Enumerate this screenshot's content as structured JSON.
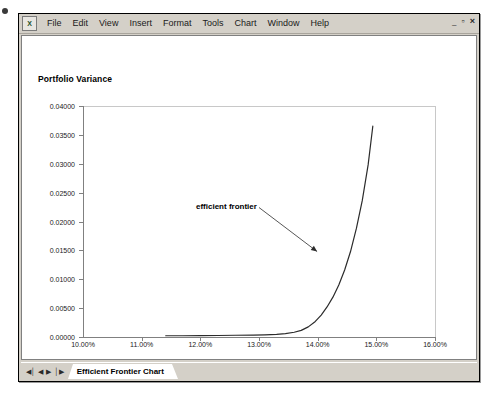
{
  "window": {
    "app_icon_glyph": "X",
    "controls": {
      "minimize": "–",
      "restore": "▫",
      "close": "×"
    }
  },
  "menu": {
    "items": [
      {
        "label": "File",
        "accel": "F"
      },
      {
        "label": "Edit",
        "accel": "E"
      },
      {
        "label": "View",
        "accel": "V"
      },
      {
        "label": "Insert",
        "accel": "I"
      },
      {
        "label": "Format",
        "accel": "o"
      },
      {
        "label": "Tools",
        "accel": "T"
      },
      {
        "label": "Chart",
        "accel": "C"
      },
      {
        "label": "Window",
        "accel": "W"
      },
      {
        "label": "Help",
        "accel": "H"
      }
    ]
  },
  "tab_bar": {
    "nav": {
      "first": "◀│",
      "prev": "◀",
      "next": "▶",
      "last": "│▶"
    },
    "active_sheet": "Efficient Frontier Chart"
  },
  "chart_data": {
    "type": "line",
    "title": "",
    "xlabel": "Portfolio Return",
    "ylabel": "Portfolio Variance",
    "xlim": [
      0.1,
      0.16
    ],
    "ylim": [
      0.0,
      0.04
    ],
    "grid": false,
    "legend": false,
    "xtick_labels": [
      "10.00%",
      "11.00%",
      "12.00%",
      "13.00%",
      "14.00%",
      "15.00%",
      "16.00%"
    ],
    "xtick_values": [
      0.1,
      0.11,
      0.12,
      0.13,
      0.14,
      0.15,
      0.16
    ],
    "ytick_labels": [
      "0.04000",
      "0.03500",
      "0.03000",
      "0.02500",
      "0.02000",
      "0.01500",
      "0.01000",
      "0.00500",
      "0.00000"
    ],
    "ytick_values": [
      0.04,
      0.035,
      0.03,
      0.025,
      0.02,
      0.015,
      0.01,
      0.005,
      0.0
    ],
    "series": [
      {
        "name": "efficient frontier",
        "x": [
          0.1141,
          0.117,
          0.12,
          0.123,
          0.126,
          0.129,
          0.131,
          0.133,
          0.1345,
          0.136,
          0.1372,
          0.1384,
          0.1396,
          0.1406,
          0.1416,
          0.1426,
          0.1436,
          0.1446,
          0.1456,
          0.1466,
          0.1476,
          0.1486,
          0.1494
        ],
        "y": [
          0.00022,
          0.00022,
          0.00024,
          0.00026,
          0.0003,
          0.00034,
          0.00038,
          0.00046,
          0.00058,
          0.00082,
          0.00115,
          0.00175,
          0.0027,
          0.0038,
          0.0052,
          0.0069,
          0.009,
          0.0116,
          0.0148,
          0.0188,
          0.0236,
          0.0298,
          0.0365
        ]
      }
    ],
    "annotations": [
      {
        "text": "efficient frontier",
        "label_x": 0.1225,
        "label_y": 0.021,
        "arrow_to_x": 0.1399,
        "arrow_to_y": 0.0148
      }
    ]
  }
}
